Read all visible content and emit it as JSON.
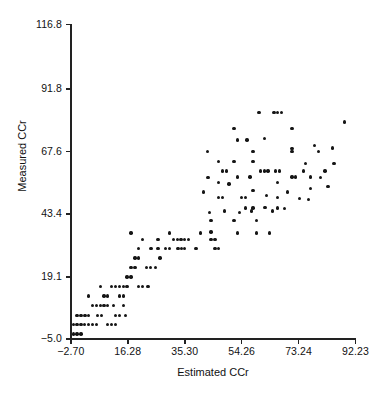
{
  "chart_data": {
    "type": "scatter",
    "title": "",
    "xlabel": "Estimated CCr",
    "ylabel": "Measured CCr",
    "xlim": [
      -2.7,
      92.23
    ],
    "ylim": [
      -5.0,
      116.8
    ],
    "grid": false,
    "legend": null,
    "marker": "filled-circle",
    "marker_color": "#151515",
    "xticks": [
      -2.7,
      16.28,
      35.3,
      54.26,
      73.24,
      92.23
    ],
    "xticklabels": [
      "−2.70",
      "16.28",
      "35.30",
      "54.26",
      "73.24",
      "92.23"
    ],
    "yticks": [
      -5.0,
      19.1,
      43.4,
      67.6,
      91.8,
      116.8
    ],
    "yticklabels": [
      "−5.0",
      "19.1",
      "43.4",
      "67.6",
      "91.8",
      "116.8"
    ],
    "n_points": 146,
    "points": [
      [
        -1.9,
        -3.0
      ],
      [
        -0.6,
        -3.0
      ],
      [
        0.7,
        -3.0
      ],
      [
        -1.9,
        0.6
      ],
      [
        -0.6,
        0.6
      ],
      [
        0.7,
        0.6
      ],
      [
        4.5,
        0.6
      ],
      [
        5.8,
        0.6
      ],
      [
        9.6,
        0.6
      ],
      [
        10.9,
        0.6
      ],
      [
        -0.6,
        4.2
      ],
      [
        0.7,
        4.2
      ],
      [
        2.0,
        4.2
      ],
      [
        3.2,
        4.2
      ],
      [
        4.5,
        8.0
      ],
      [
        5.8,
        8.0
      ],
      [
        7.1,
        8.0
      ],
      [
        8.4,
        8.0
      ],
      [
        9.6,
        8.0
      ],
      [
        12.2,
        4.2
      ],
      [
        13.5,
        4.2
      ],
      [
        3.2,
        11.6
      ],
      [
        8.4,
        11.6
      ],
      [
        9.6,
        11.6
      ],
      [
        12.2,
        0.6
      ],
      [
        7.1,
        15.3
      ],
      [
        10.9,
        15.3
      ],
      [
        12.2,
        15.3
      ],
      [
        13.5,
        15.3
      ],
      [
        14.8,
        15.3
      ],
      [
        16.1,
        15.3
      ],
      [
        13.5,
        11.6
      ],
      [
        14.8,
        11.6
      ],
      [
        19.9,
        15.3
      ],
      [
        21.2,
        15.3
      ],
      [
        16.1,
        19.0
      ],
      [
        17.4,
        19.0
      ],
      [
        17.4,
        22.8
      ],
      [
        18.7,
        22.8
      ],
      [
        22.5,
        22.8
      ],
      [
        23.8,
        22.8
      ],
      [
        18.7,
        26.4
      ],
      [
        19.9,
        26.4
      ],
      [
        19.9,
        30.1
      ],
      [
        17.4,
        36.0
      ],
      [
        21.2,
        33.5
      ],
      [
        26.4,
        33.5
      ],
      [
        24.0,
        30.1
      ],
      [
        26.4,
        30.1
      ],
      [
        28.9,
        30.1
      ],
      [
        30.2,
        30.1
      ],
      [
        31.5,
        33.5
      ],
      [
        32.8,
        33.5
      ],
      [
        34.0,
        33.5
      ],
      [
        35.3,
        33.5
      ],
      [
        33.0,
        30.1
      ],
      [
        34.3,
        30.1
      ],
      [
        30.2,
        36.0
      ],
      [
        39.0,
        30.1
      ],
      [
        42.8,
        67.6
      ],
      [
        44.1,
        33.5
      ],
      [
        45.4,
        33.5
      ],
      [
        44.1,
        36.5
      ],
      [
        44.1,
        40.8
      ],
      [
        46.6,
        63.8
      ],
      [
        47.9,
        60.0
      ],
      [
        49.2,
        60.0
      ],
      [
        46.6,
        55.5
      ],
      [
        46.6,
        49.8
      ],
      [
        47.9,
        49.8
      ],
      [
        45.4,
        30.1
      ],
      [
        46.6,
        30.1
      ],
      [
        51.7,
        76.5
      ],
      [
        52.9,
        72.0
      ],
      [
        51.7,
        63.8
      ],
      [
        52.9,
        57.8
      ],
      [
        54.2,
        49.8
      ],
      [
        55.5,
        49.8
      ],
      [
        51.7,
        40.8
      ],
      [
        52.9,
        36.0
      ],
      [
        55.5,
        45.8
      ],
      [
        58.0,
        67.6
      ],
      [
        58.0,
        63.8
      ],
      [
        57.0,
        57.8
      ],
      [
        58.0,
        52.5
      ],
      [
        58.0,
        45.8
      ],
      [
        59.3,
        40.8
      ],
      [
        59.3,
        36.0
      ],
      [
        60.0,
        82.8
      ],
      [
        61.8,
        72.6
      ],
      [
        60.5,
        60.0
      ],
      [
        61.8,
        60.0
      ],
      [
        63.1,
        60.0
      ],
      [
        62.5,
        50.5
      ],
      [
        65.0,
        82.8
      ],
      [
        66.3,
        82.8
      ],
      [
        67.6,
        82.8
      ],
      [
        65.6,
        60.0
      ],
      [
        66.9,
        60.0
      ],
      [
        66.3,
        55.5
      ],
      [
        66.3,
        49.8
      ],
      [
        66.3,
        45.8
      ],
      [
        71.0,
        76.5
      ],
      [
        71.0,
        68.8
      ],
      [
        71.0,
        67.6
      ],
      [
        71.0,
        57.8
      ],
      [
        72.3,
        57.8
      ],
      [
        74.8,
        60.0
      ],
      [
        78.5,
        70.0
      ],
      [
        79.8,
        67.6
      ],
      [
        77.3,
        57.8
      ],
      [
        77.3,
        53.3
      ],
      [
        88.5,
        79.0
      ],
      [
        1.9,
        0.6
      ],
      [
        3.2,
        0.6
      ],
      [
        6.3,
        4.2
      ],
      [
        7.6,
        4.2
      ],
      [
        11.5,
        8.0
      ],
      [
        14.8,
        8.0
      ],
      [
        15.5,
        4.2
      ],
      [
        23.0,
        15.3
      ],
      [
        25.5,
        22.8
      ],
      [
        27.0,
        26.4
      ],
      [
        35.3,
        30.1
      ],
      [
        36.5,
        33.5
      ],
      [
        40.5,
        36.0
      ],
      [
        43.5,
        44.0
      ],
      [
        48.5,
        44.5
      ],
      [
        50.0,
        55.0
      ],
      [
        53.5,
        44.0
      ],
      [
        56.0,
        72.0
      ],
      [
        57.5,
        44.5
      ],
      [
        62.0,
        46.0
      ],
      [
        63.5,
        36.0
      ],
      [
        64.5,
        44.5
      ],
      [
        68.5,
        45.5
      ],
      [
        69.5,
        52.0
      ],
      [
        73.5,
        49.5
      ],
      [
        75.5,
        63.0
      ],
      [
        76.5,
        49.0
      ],
      [
        80.5,
        57.5
      ],
      [
        82.0,
        60.0
      ],
      [
        83.0,
        54.0
      ],
      [
        84.5,
        69.0
      ],
      [
        85.0,
        63.0
      ],
      [
        41.5,
        52.0
      ],
      [
        43.0,
        57.5
      ]
    ]
  }
}
